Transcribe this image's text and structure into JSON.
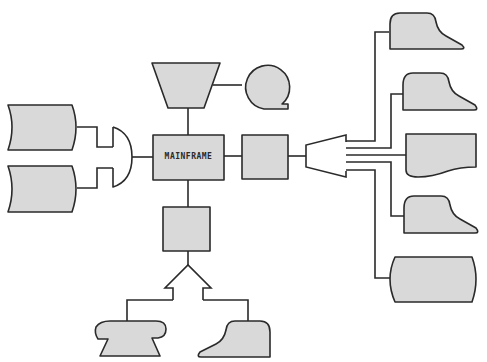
{
  "diagram": {
    "type": "computer-system-block-diagram",
    "colors": {
      "shape_fill": "#d9d9d9",
      "stroke": "#2a2a2a",
      "background": "#ffffff"
    },
    "nodes": [
      {
        "id": "mainframe",
        "shape": "rectangle",
        "label": "MAINFRAME"
      },
      {
        "id": "manual-input",
        "shape": "trapezoid",
        "label": ""
      },
      {
        "id": "magnetic-tape",
        "shape": "tape-reel",
        "label": ""
      },
      {
        "id": "disk-storage-1",
        "shape": "stored-data",
        "label": ""
      },
      {
        "id": "disk-storage-2",
        "shape": "stored-data",
        "label": ""
      },
      {
        "id": "multiplexer-left",
        "shape": "half-circle",
        "label": ""
      },
      {
        "id": "communication-controller",
        "shape": "rectangle",
        "label": ""
      },
      {
        "id": "fan-out-multiplexer",
        "shape": "funnel",
        "label": ""
      },
      {
        "id": "terminal-1",
        "shape": "terminal",
        "label": ""
      },
      {
        "id": "terminal-2",
        "shape": "terminal",
        "label": ""
      },
      {
        "id": "document-printer",
        "shape": "document",
        "label": ""
      },
      {
        "id": "terminal-3",
        "shape": "terminal",
        "label": ""
      },
      {
        "id": "display",
        "shape": "display",
        "label": ""
      },
      {
        "id": "remote-controller",
        "shape": "rectangle",
        "label": ""
      },
      {
        "id": "splitter",
        "shape": "arrow-split",
        "label": ""
      },
      {
        "id": "telephone",
        "shape": "telephone",
        "label": ""
      },
      {
        "id": "terminal-4",
        "shape": "terminal",
        "label": ""
      }
    ],
    "edges": [
      [
        "disk-storage-1",
        "multiplexer-left"
      ],
      [
        "disk-storage-2",
        "multiplexer-left"
      ],
      [
        "multiplexer-left",
        "mainframe"
      ],
      [
        "manual-input",
        "mainframe"
      ],
      [
        "manual-input",
        "magnetic-tape"
      ],
      [
        "mainframe",
        "communication-controller"
      ],
      [
        "communication-controller",
        "fan-out-multiplexer"
      ],
      [
        "fan-out-multiplexer",
        "terminal-1"
      ],
      [
        "fan-out-multiplexer",
        "terminal-2"
      ],
      [
        "fan-out-multiplexer",
        "document-printer"
      ],
      [
        "fan-out-multiplexer",
        "terminal-3"
      ],
      [
        "fan-out-multiplexer",
        "display"
      ],
      [
        "mainframe",
        "remote-controller"
      ],
      [
        "remote-controller",
        "splitter"
      ],
      [
        "splitter",
        "telephone"
      ],
      [
        "splitter",
        "terminal-4"
      ]
    ]
  }
}
